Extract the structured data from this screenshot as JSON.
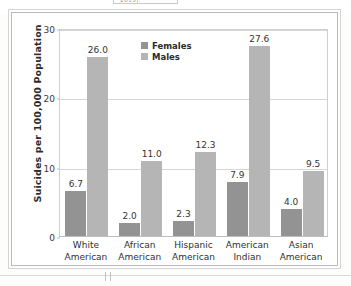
{
  "page": {
    "cut_caption_fragment": "2013).",
    "figure_background": "#ffffff",
    "frame_color": "#b9b9b9"
  },
  "chart_data": {
    "type": "bar",
    "title": "",
    "xlabel": "",
    "ylabel": "Suicides per 100,000 Population",
    "categories": [
      "White American",
      "African American",
      "Hispanic American",
      "American Indian",
      "Asian American"
    ],
    "category_lines": [
      [
        "White",
        "American"
      ],
      [
        "African",
        "American"
      ],
      [
        "Hispanic",
        "American"
      ],
      [
        "American",
        "Indian"
      ],
      [
        "Asian",
        "American"
      ]
    ],
    "series": [
      {
        "name": "Females",
        "color": "#939393",
        "values": [
          6.7,
          2.0,
          2.3,
          7.9,
          4.0
        ],
        "labels": [
          "6.7",
          "2.0",
          "2.3",
          "7.9",
          "4.0"
        ]
      },
      {
        "name": "Males",
        "color": "#b5b5b5",
        "values": [
          26.0,
          11.0,
          12.3,
          27.6,
          9.5
        ],
        "labels": [
          "26.0",
          "11.0",
          "12.3",
          "27.6",
          "9.5"
        ]
      }
    ],
    "ylim": [
      0,
      30
    ],
    "yticks": [
      0,
      10,
      20,
      30
    ],
    "ytick_labels": [
      "0",
      "10",
      "20",
      "30"
    ],
    "grid": true,
    "grid_axis": "y",
    "legend_position": "top-center",
    "legend": [
      {
        "label": "Females",
        "color": "#939393"
      },
      {
        "label": "Males",
        "color": "#b5b5b5"
      }
    ]
  }
}
